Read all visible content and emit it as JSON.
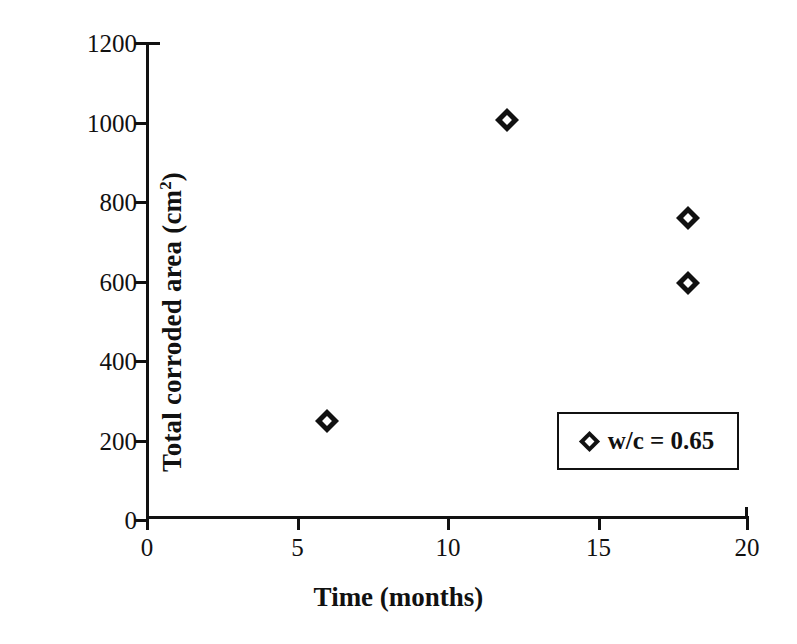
{
  "chart_data": {
    "type": "scatter",
    "title": "",
    "xlabel": "Time (months)",
    "ylabel": "Total corroded area (cm²)",
    "ylabel_base": "Total corroded area (cm",
    "ylabel_sup": "2",
    "ylabel_close": ")",
    "xlim": [
      0,
      20
    ],
    "ylim": [
      0,
      1200
    ],
    "xticks": [
      0,
      5,
      10,
      15,
      20
    ],
    "yticks": [
      0,
      200,
      400,
      600,
      800,
      1000,
      1200
    ],
    "xtick_labels": [
      "0",
      "5",
      "10",
      "15",
      "20"
    ],
    "ytick_labels": [
      "0",
      "200",
      "400",
      "600",
      "800",
      "1000",
      "1200"
    ],
    "grid": false,
    "legend_position": "lower right",
    "series": [
      {
        "name": "w/c = 0.65",
        "marker": "diamond",
        "color": "#111111",
        "x": [
          6,
          12,
          18,
          18
        ],
        "y": [
          247,
          1003,
          756,
          594
        ],
        "points": [
          {
            "x": 6,
            "y": 247
          },
          {
            "x": 12,
            "y": 1003
          },
          {
            "x": 18,
            "y": 756
          },
          {
            "x": 18,
            "y": 594
          }
        ]
      }
    ]
  },
  "legend": {
    "entries": [
      {
        "label": "w/c = 0.65",
        "marker": "diamond-marker-icon"
      }
    ]
  },
  "axes": {
    "x_title": "Time (months)",
    "y_title_base": "Total corroded area (cm",
    "y_title_sup": "2",
    "y_title_close": ")"
  }
}
